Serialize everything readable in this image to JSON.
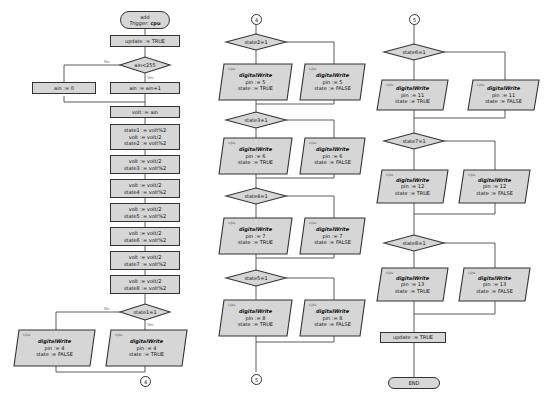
{
  "colors": {
    "node_fill": "#d6d6d6",
    "stroke": "#333333",
    "label": "#777777"
  },
  "start": {
    "title": "add",
    "trigger_label": "Trigger:",
    "trigger_value": "cpu"
  },
  "col1": {
    "update": "update := TRUE",
    "cond_ain": "ain<255",
    "no_label": "No",
    "yes_label": "Yes",
    "ain_reset": "ain := 0",
    "ain_inc": "ain := ain+1",
    "volt_assign": "volt := ain",
    "block1": [
      "state1 := volt%2",
      "volt := volt/2",
      "state2 := volt%2"
    ],
    "block2": [
      "volt := volt/2",
      "state3 := volt%2"
    ],
    "block3": [
      "volt := volt/2",
      "state4 := volt%2"
    ],
    "block4": [
      "volt := volt/2",
      "state5 := volt%2"
    ],
    "block5": [
      "volt := volt/2",
      "state6 := volt%2"
    ],
    "block6": [
      "volt := volt/2",
      "state7 := volt%2"
    ],
    "block7": [
      "volt := volt/2",
      "state8 := volt%2"
    ],
    "cond_state1": "state1=1",
    "dw_false": {
      "cpu": "cpu",
      "fn": "digitalWrite",
      "pin": "pin := 4",
      "state": "state := FALSE"
    },
    "dw_true": {
      "cpu": "cpu",
      "fn": "digitalWrite",
      "pin": "pin := 4",
      "state": "state := TRUE"
    },
    "connector_out": "4"
  },
  "col2": {
    "connector_in": "4",
    "decisions": [
      {
        "cond": "state2=1",
        "pin": "pin := 5"
      },
      {
        "cond": "state3=1",
        "pin": "pin := 6"
      },
      {
        "cond": "state4=1",
        "pin": "pin := 7"
      },
      {
        "cond": "state5=1",
        "pin": "pin := 8"
      }
    ],
    "connector_out": "5"
  },
  "col3": {
    "connector_in": "5",
    "decisions": [
      {
        "cond": "state6=1",
        "pin": "pin := 11"
      },
      {
        "cond": "state7=1",
        "pin": "pin := 12"
      },
      {
        "cond": "state8=1",
        "pin": "pin := 13"
      }
    ],
    "update": "update := TRUE",
    "end": "END"
  },
  "common": {
    "cpu": "cpu",
    "fn": "digitalWrite",
    "state_true": "state := TRUE",
    "state_false": "state := FALSE",
    "yes": "Yes",
    "no": "No"
  }
}
